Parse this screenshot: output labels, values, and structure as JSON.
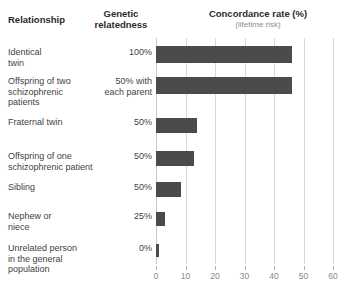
{
  "header": {
    "col_relationship": "Relationship",
    "col_genetic": "Genetic relatedness",
    "col_genetic_line1": "Genetic",
    "col_genetic_line2": "relatedness",
    "col_concordance": "Concordance rate (%)",
    "col_concordance_sub": "(lifetime risk)"
  },
  "axis": {
    "ticks": [
      "0",
      "10",
      "20",
      "30",
      "40",
      "50",
      "60"
    ]
  },
  "rows": [
    {
      "label": "Identical twin",
      "label_line1": "Identical",
      "label_line2": "twin",
      "genetic": "100%",
      "genetic_line1": "100%",
      "genetic_line2": "",
      "value": 46
    },
    {
      "label": "Offspring of two schizophrenic patients",
      "label_line1": "Offspring of two",
      "label_line2": "schizophrenic",
      "label_line3": "patients",
      "genetic": "50% with each parent",
      "genetic_line1": "50% with",
      "genetic_line2": "each parent",
      "value": 46
    },
    {
      "label": "Fraternal twin",
      "label_line1": "Fraternal twin",
      "label_line2": "",
      "genetic": "50%",
      "genetic_line1": "50%",
      "genetic_line2": "",
      "value": 14
    },
    {
      "label": "Offspring of one schizophrenic patient",
      "label_line1": "Offspring of one",
      "label_line2": "schizophrenic patient",
      "genetic": "50%",
      "genetic_line1": "50%",
      "genetic_line2": "",
      "value": 13
    },
    {
      "label": "Sibling",
      "label_line1": "Sibling",
      "label_line2": "",
      "genetic": "50%",
      "genetic_line1": "50%",
      "genetic_line2": "",
      "value": 8.5
    },
    {
      "label": "Nephew or niece",
      "label_line1": "Nephew or",
      "label_line2": "niece",
      "genetic": "25%",
      "genetic_line1": "25%",
      "genetic_line2": "",
      "value": 3
    },
    {
      "label": "Unrelated person in the general population",
      "label_line1": "Unrelated person",
      "label_line2": "in the general",
      "label_line3": "population",
      "genetic": "0%",
      "genetic_line1": "0%",
      "genetic_line2": "",
      "value": 1
    }
  ],
  "colors": {
    "bar": "#4b4b4b",
    "grid": "#d9d9d9",
    "text": "#3f3f3f",
    "header_text": "#2b2b2b",
    "subtitle_text": "#8c8c8c",
    "tick_text": "#888888"
  },
  "chart_data": {
    "type": "bar",
    "orientation": "horizontal",
    "title": "Concordance rate (%)",
    "subtitle": "(lifetime risk)",
    "xlabel": "Concordance rate (%)",
    "ylabel": "Relationship",
    "xlim": [
      0,
      60
    ],
    "xticks": [
      0,
      10,
      20,
      30,
      40,
      50,
      60
    ],
    "grid": true,
    "legend": "none",
    "categories": [
      "Identical twin",
      "Offspring of two schizophrenic patients",
      "Fraternal twin",
      "Offspring of one schizophrenic patient",
      "Sibling",
      "Nephew or niece",
      "Unrelated person in the general population"
    ],
    "values": [
      46,
      46,
      14,
      13,
      8.5,
      3,
      1
    ],
    "annotations": {
      "genetic_relatedness": [
        "100%",
        "50% with each parent",
        "50%",
        "50%",
        "50%",
        "25%",
        "0%"
      ]
    }
  }
}
